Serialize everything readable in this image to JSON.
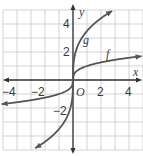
{
  "graph": {
    "origin_px": [
      73,
      80
    ],
    "unit_px": 14,
    "x_range": [
      -5,
      5
    ],
    "y_range": [
      -5,
      5
    ],
    "grid_color": "#c8c8c8",
    "axis_color": "#333333",
    "curve_color": "#555555",
    "axis_labels": {
      "x": "x",
      "y": "y",
      "origin": "O"
    },
    "x_ticks": [
      {
        "value": -4,
        "label": "−4"
      },
      {
        "value": -2,
        "label": "−2"
      },
      {
        "value": 2,
        "label": "2"
      },
      {
        "value": 4,
        "label": "4"
      }
    ],
    "y_ticks": [
      {
        "value": 4,
        "label": "4"
      },
      {
        "value": 2,
        "label": "2"
      },
      {
        "value": -2,
        "label": "−2"
      }
    ],
    "curves": [
      {
        "name": "f",
        "label": "f",
        "description": "cube-root-like curve, flatter"
      },
      {
        "name": "g",
        "label": "g",
        "description": "steeper cube-root-like curve"
      }
    ]
  }
}
